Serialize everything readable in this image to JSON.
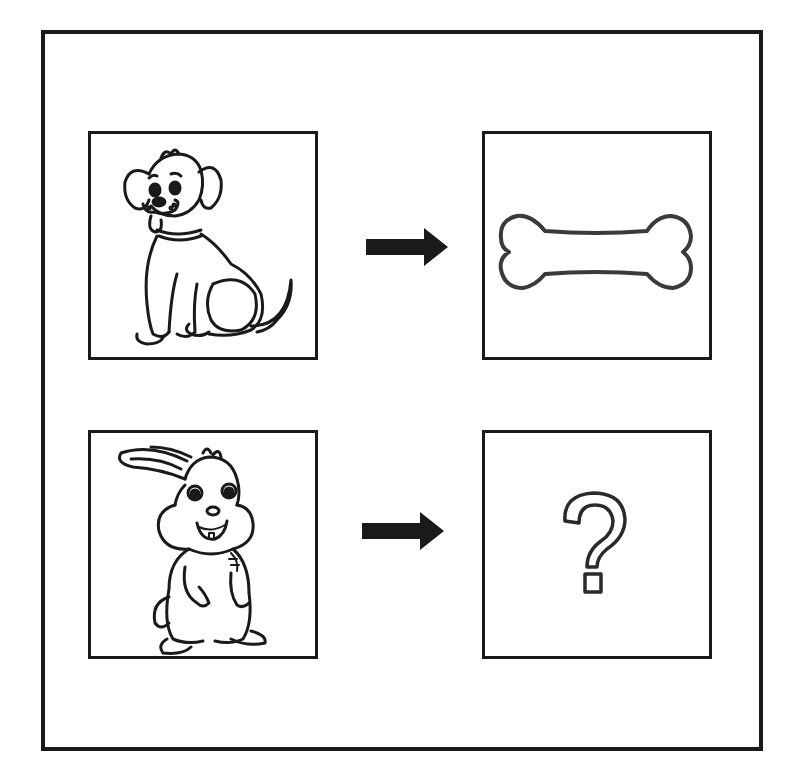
{
  "puzzle": {
    "type": "analogy",
    "rows": [
      {
        "left": {
          "subject": "dog",
          "label": "Dog"
        },
        "arrow": "right-arrow",
        "right": {
          "subject": "bone",
          "label": "Bone"
        }
      },
      {
        "left": {
          "subject": "rabbit",
          "label": "Rabbit"
        },
        "arrow": "right-arrow",
        "right": {
          "subject": "unknown",
          "label": "?"
        }
      }
    ],
    "question_mark": "?"
  },
  "colors": {
    "ink": "#1a1a1a",
    "background": "#ffffff"
  }
}
